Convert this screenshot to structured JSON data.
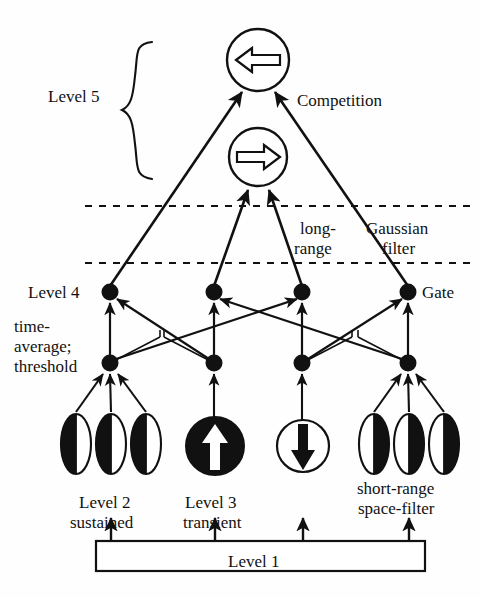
{
  "diagram": {
    "colors": {
      "ink": "#111111",
      "fill_black": "#111111",
      "fill_white": "#ffffff",
      "background": "#fefefe"
    },
    "labels": {
      "level5": "Level 5",
      "competition": "Competition",
      "long_range_line1": "long-",
      "long_range_line2": "range",
      "gaussian_line1": "Gaussian",
      "gaussian_line2": "filter",
      "level4": "Level 4",
      "gate": "Gate",
      "time_average_line1": "time-",
      "time_average_line2": "average;",
      "time_average_line3": "threshold",
      "level2_line1": "Level 2",
      "level2_line2": "sustained",
      "level3_line1": "Level 3",
      "level3_line2": "transient",
      "short_range_line1": "short-range",
      "short_range_line2": "space-filter",
      "level1": "Level 1"
    },
    "nodes": {
      "competition_circle": {
        "name": "left-arrow-circle",
        "cx": 258,
        "cy": 60,
        "r": 31,
        "arrow_direction": "left",
        "arrow_style": "hollow"
      },
      "directional_circle": {
        "name": "right-arrow-circle",
        "cx": 258,
        "cy": 157,
        "r": 29,
        "arrow_direction": "right",
        "arrow_style": "hollow"
      },
      "level4_nodes": [
        {
          "id": "l4-1",
          "cx": 110,
          "cy": 292,
          "r": 8
        },
        {
          "id": "l4-2",
          "cx": 214,
          "cy": 292,
          "r": 8
        },
        {
          "id": "l4-3",
          "cx": 302,
          "cy": 292,
          "r": 8
        },
        {
          "id": "l4-4",
          "cx": 408,
          "cy": 292,
          "r": 8
        }
      ],
      "threshold_nodes": [
        {
          "id": "th-1",
          "cx": 110,
          "cy": 363,
          "r": 8
        },
        {
          "id": "th-2",
          "cx": 214,
          "cy": 363,
          "r": 8
        },
        {
          "id": "th-3",
          "cx": 302,
          "cy": 363,
          "r": 8
        },
        {
          "id": "th-4",
          "cx": 408,
          "cy": 363,
          "r": 8
        }
      ],
      "sustained_cells": [
        {
          "id": "s-1",
          "cx": 76,
          "cy": 444,
          "rx": 15,
          "ry": 30,
          "fill_side": "left"
        },
        {
          "id": "s-2",
          "cx": 111,
          "cy": 444,
          "rx": 15,
          "ry": 30,
          "fill_side": "left"
        },
        {
          "id": "s-3",
          "cx": 146,
          "cy": 444,
          "rx": 15,
          "ry": 30,
          "fill_side": "left"
        }
      ],
      "space_filter_cells": [
        {
          "id": "f-1",
          "cx": 374,
          "cy": 444,
          "rx": 15,
          "ry": 30,
          "fill_side": "right"
        },
        {
          "id": "f-2",
          "cx": 409,
          "cy": 444,
          "rx": 15,
          "ry": 30,
          "fill_side": "right"
        },
        {
          "id": "f-3",
          "cx": 444,
          "cy": 444,
          "rx": 15,
          "ry": 30,
          "fill_side": "right"
        }
      ],
      "transient_up": {
        "id": "t-up",
        "cx": 215,
        "cy": 446,
        "r": 29,
        "circle_fill": "black",
        "arrow_direction": "up",
        "arrow_fill": "white"
      },
      "transient_down": {
        "id": "t-down",
        "cx": 303,
        "cy": 446,
        "r": 26,
        "circle_fill": "white",
        "arrow_direction": "down",
        "arrow_fill": "black"
      },
      "level1_box": {
        "x": 96,
        "y": 541,
        "width": 329,
        "height": 30
      }
    },
    "dashed_lines": [
      {
        "id": "dash-upper",
        "y": 206,
        "x1": 85,
        "x2": 472
      },
      {
        "id": "dash-lower",
        "y": 263,
        "x1": 85,
        "x2": 472
      }
    ],
    "brace": {
      "x": 123,
      "y_top": 42,
      "y_bottom": 180
    }
  }
}
